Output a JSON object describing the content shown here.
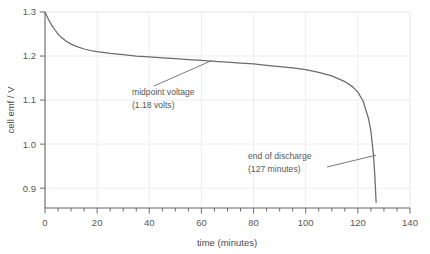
{
  "chart_data": {
    "type": "line",
    "title": "",
    "xlabel": "time (minutes)",
    "ylabel": "cell emf / V",
    "xlim": [
      0,
      140
    ],
    "ylim": [
      0.855,
      1.3
    ],
    "xticks": [
      0,
      20,
      40,
      60,
      80,
      100,
      120,
      140
    ],
    "xticklabels": [
      "0",
      "20",
      "40",
      "60",
      "80",
      "100",
      "120",
      "140"
    ],
    "xminor_step": 5,
    "yticks": [
      0.9,
      1.0,
      1.1,
      1.2,
      1.3
    ],
    "yticklabels": [
      "0.9",
      "1.0",
      "1.1",
      "1.2",
      "1.3"
    ],
    "grid": true,
    "legend": "none",
    "series": [
      {
        "name": "cell emf discharge curve",
        "color": "#6b6b6b",
        "x": [
          0,
          1,
          2,
          3,
          4,
          5,
          6,
          8,
          10,
          12,
          15,
          18,
          20,
          25,
          30,
          35,
          40,
          45,
          50,
          55,
          60,
          65,
          70,
          75,
          80,
          85,
          90,
          95,
          100,
          105,
          110,
          115,
          118,
          120,
          122,
          124,
          125,
          126,
          126.5,
          127
        ],
        "y": [
          1.3,
          1.287,
          1.276,
          1.266,
          1.258,
          1.25,
          1.244,
          1.234,
          1.227,
          1.222,
          1.216,
          1.212,
          1.21,
          1.206,
          1.203,
          1.2,
          1.198,
          1.196,
          1.194,
          1.192,
          1.19,
          1.188,
          1.186,
          1.184,
          1.182,
          1.179,
          1.176,
          1.173,
          1.169,
          1.163,
          1.155,
          1.142,
          1.13,
          1.118,
          1.098,
          1.06,
          1.03,
          0.975,
          0.93,
          0.868
        ]
      }
    ],
    "annotations": [
      {
        "id": "midpoint-voltage",
        "line1": "midpoint voltage",
        "line2": "(1.18 volts)",
        "value": 1.18,
        "point_x": 64,
        "point_y": 1.19
      },
      {
        "id": "end-of-discharge",
        "line1": "end of discharge",
        "line2": "(127 minutes)",
        "value": 127,
        "point_x": 127,
        "point_y": 0.975
      }
    ]
  }
}
